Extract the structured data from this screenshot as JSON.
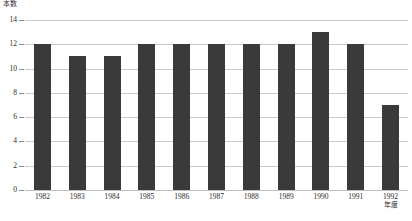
{
  "chart_data": {
    "type": "bar",
    "title": "",
    "subtitle": "",
    "xlabel": "年度",
    "ylabel": "本数",
    "categories": [
      "1982",
      "1983",
      "1984",
      "1985",
      "1986",
      "1987",
      "1988",
      "1989",
      "1990",
      "1991",
      "1992"
    ],
    "values": [
      12,
      11,
      11,
      12,
      12,
      12,
      12,
      12,
      13,
      12,
      7
    ],
    "series": [
      {
        "name": "本数",
        "values": [
          12,
          11,
          11,
          12,
          12,
          12,
          12,
          12,
          13,
          12,
          7
        ]
      }
    ],
    "ylim": [
      0,
      14
    ],
    "yticks": [
      0,
      2,
      4,
      6,
      8,
      10,
      12,
      14
    ],
    "ytick_labels": [
      "0",
      "2",
      "4",
      "6",
      "8",
      "10",
      "12",
      "14"
    ],
    "grid": true,
    "legend": false,
    "legend_position": "none",
    "bar_color": "#3a3a3a",
    "grid_color": "#c9c9c9",
    "background_color": "#ffffff",
    "annotations": []
  }
}
